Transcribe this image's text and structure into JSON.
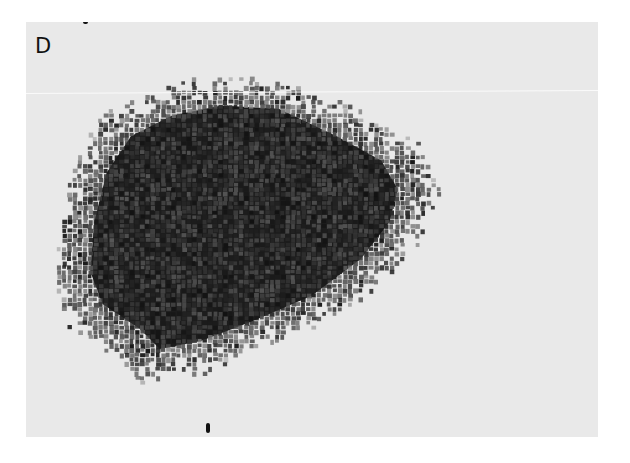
{
  "figure": {
    "panel_label": "D",
    "content": "grayscale micrograph of a dense dark particle cluster (mosaic of small dark grains) on a light background",
    "colors": {
      "background": "#e9e9e9",
      "grain_dark": "#141414",
      "page": "#ffffff"
    }
  }
}
